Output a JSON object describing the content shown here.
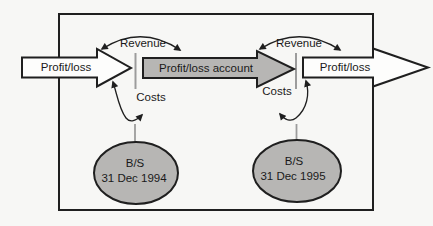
{
  "diagram": {
    "arrows": {
      "incoming_label": "Profit/loss",
      "account_label": "Profit/loss account",
      "outgoing_label": "Profit/loss"
    },
    "period_1994": {
      "revenue_label": "Revenue",
      "costs_label": "Costs",
      "balance_sheet_abbrev": "B/S",
      "balance_sheet_date": "31 Dec 1994"
    },
    "period_1995": {
      "revenue_label": "Revenue",
      "costs_label": "Costs",
      "balance_sheet_abbrev": "B/S",
      "balance_sheet_date": "31 Dec 1995"
    },
    "colors": {
      "shape_fill_gray": "#b7b6b4",
      "outline_black": "#1f1f1f",
      "divider_gray": "#9c9c9c",
      "background": "#f7f7f5"
    }
  }
}
